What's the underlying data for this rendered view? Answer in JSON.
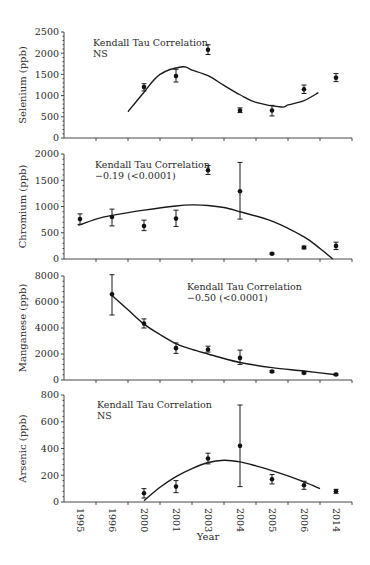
{
  "chart_data": {
    "type": "scatter",
    "x_title": "Year",
    "categories": [
      "1995",
      "1996",
      "2000",
      "2001",
      "2003",
      "2004",
      "2005",
      "2006",
      "2014"
    ],
    "panels": [
      {
        "name": "selenium",
        "ylabel": "Selenium (ppb)",
        "ylim": [
          0,
          2500
        ],
        "yticks": [
          0,
          500,
          1000,
          1500,
          2000,
          2500
        ],
        "annotation": [
          "Kendall Tau Correlation",
          "NS"
        ],
        "points": [
          {
            "x": "2000",
            "y": 1200,
            "err": [
              1110,
              1280
            ]
          },
          {
            "x": "2001",
            "y": 1460,
            "err": [
              1320,
              1620
            ]
          },
          {
            "x": "2003",
            "y": 2080,
            "err": [
              1970,
              2200
            ]
          },
          {
            "x": "2004",
            "y": 650,
            "err": [
              600,
              710
            ]
          },
          {
            "x": "2005",
            "y": 650,
            "err": [
              520,
              770
            ]
          },
          {
            "x": "2006",
            "y": 1150,
            "err": [
              1050,
              1250
            ]
          },
          {
            "x": "2014",
            "y": 1420,
            "err": [
              1330,
              1520
            ]
          }
        ],
        "fit_curve": [
          [
            "2000",
            -0.5,
            620
          ],
          [
            "2000",
            0,
            1080
          ],
          [
            "2001",
            -0.5,
            1500
          ],
          [
            "2001",
            0.2,
            1680
          ],
          [
            "2003",
            -0.5,
            1600
          ],
          [
            "2003",
            0,
            1470
          ],
          [
            "2004",
            -0.5,
            1240
          ],
          [
            "2004",
            0,
            1020
          ],
          [
            "2005",
            -0.5,
            840
          ],
          [
            "2005",
            0.3,
            730
          ],
          [
            "2006",
            -0.5,
            780
          ],
          [
            "2006",
            0,
            880
          ],
          [
            "2006",
            0.45,
            1070
          ]
        ]
      },
      {
        "name": "chromium",
        "ylabel": "Chromium (ppb)",
        "ylim": [
          0,
          2000
        ],
        "yticks": [
          0,
          500,
          1000,
          1500,
          2000
        ],
        "annotation": [
          "Kendall Tau Correlation",
          "−0.19 (<0.0001)"
        ],
        "points": [
          {
            "x": "1995",
            "y": 760,
            "err": [
              660,
              860
            ]
          },
          {
            "x": "1996",
            "y": 800,
            "err": [
              630,
              950
            ]
          },
          {
            "x": "2000",
            "y": 630,
            "err": [
              540,
              740
            ]
          },
          {
            "x": "2001",
            "y": 770,
            "err": [
              620,
              930
            ]
          },
          {
            "x": "2003",
            "y": 1690,
            "err": [
              1610,
              1780
            ]
          },
          {
            "x": "2004",
            "y": 1290,
            "err": [
              760,
              1840
            ]
          },
          {
            "x": "2005",
            "y": 100,
            "err": [
              85,
              115
            ]
          },
          {
            "x": "2006",
            "y": 220,
            "err": [
              195,
              245
            ]
          },
          {
            "x": "2014",
            "y": 250,
            "err": [
              180,
              320
            ]
          }
        ],
        "fit_curve": [
          [
            "1995",
            -0.05,
            640
          ],
          [
            "1996",
            -0.5,
            760
          ],
          [
            "1996",
            0,
            830
          ],
          [
            "2000",
            0,
            930
          ],
          [
            "2001",
            0,
            1010
          ],
          [
            "2003",
            -0.5,
            1030
          ],
          [
            "2003",
            0,
            1020
          ],
          [
            "2004",
            -0.5,
            980
          ],
          [
            "2004",
            0,
            900
          ],
          [
            "2005",
            0,
            720
          ],
          [
            "2006",
            0,
            420
          ],
          [
            "2014",
            -0.5,
            200
          ],
          [
            "2014",
            -0.1,
            0
          ]
        ]
      },
      {
        "name": "manganese",
        "ylabel": "Manganese (ppb)",
        "ylim": [
          0,
          8000
        ],
        "yticks": [
          0,
          2000,
          4000,
          6000,
          8000
        ],
        "annotation": [
          "Kendall Tau Correlation",
          "−0.50 (<0.0001)"
        ],
        "points": [
          {
            "x": "1996",
            "y": 6600,
            "err": [
              5000,
              8100
            ]
          },
          {
            "x": "2000",
            "y": 4350,
            "err": [
              4000,
              4700
            ]
          },
          {
            "x": "2001",
            "y": 2450,
            "err": [
              2050,
              2850
            ]
          },
          {
            "x": "2003",
            "y": 2350,
            "err": [
              2150,
              2600
            ]
          },
          {
            "x": "2004",
            "y": 1700,
            "err": [
              1200,
              2300
            ]
          },
          {
            "x": "2005",
            "y": 650,
            "err": [
              580,
              720
            ]
          },
          {
            "x": "2006",
            "y": 550,
            "err": [
              480,
              620
            ]
          },
          {
            "x": "2014",
            "y": 420,
            "err": [
              360,
              480
            ]
          }
        ],
        "fit_curve": [
          [
            "1996",
            0,
            6500
          ],
          [
            "1996",
            0.5,
            5400
          ],
          [
            "2000",
            0,
            4300
          ],
          [
            "2000",
            0.5,
            3500
          ],
          [
            "2001",
            0,
            2800
          ],
          [
            "2001",
            0.5,
            2350
          ],
          [
            "2003",
            0,
            2000
          ],
          [
            "2003",
            0.5,
            1650
          ],
          [
            "2004",
            0,
            1350
          ],
          [
            "2005",
            0,
            950
          ],
          [
            "2006",
            0,
            690
          ],
          [
            "2014",
            0,
            400
          ]
        ]
      },
      {
        "name": "arsenic",
        "ylabel": "Arsenic (ppb)",
        "ylim": [
          0,
          800
        ],
        "yticks": [
          0,
          200,
          400,
          600,
          800
        ],
        "annotation": [
          "Kendall Tau Correlation",
          "NS"
        ],
        "points": [
          {
            "x": "2000",
            "y": 65,
            "err": [
              30,
              100
            ]
          },
          {
            "x": "2001",
            "y": 115,
            "err": [
              70,
              160
            ]
          },
          {
            "x": "2003",
            "y": 325,
            "err": [
              285,
              365
            ]
          },
          {
            "x": "2004",
            "y": 420,
            "err": [
              115,
              725
            ]
          },
          {
            "x": "2005",
            "y": 170,
            "err": [
              135,
              205
            ]
          },
          {
            "x": "2006",
            "y": 125,
            "err": [
              95,
              155
            ]
          },
          {
            "x": "2014",
            "y": 80,
            "err": [
              65,
              95
            ]
          }
        ],
        "fit_curve": [
          [
            "2000",
            0,
            10
          ],
          [
            "2000",
            0.5,
            110
          ],
          [
            "2001",
            0,
            190
          ],
          [
            "2001",
            0.5,
            250
          ],
          [
            "2003",
            0,
            295
          ],
          [
            "2003",
            0.5,
            312
          ],
          [
            "2004",
            0,
            300
          ],
          [
            "2004",
            0.5,
            270
          ],
          [
            "2005",
            0,
            235
          ],
          [
            "2005",
            0.5,
            195
          ],
          [
            "2006",
            0,
            150
          ],
          [
            "2006",
            0.5,
            100
          ]
        ]
      }
    ]
  },
  "labels": {
    "x_title": "Year",
    "selenium_ylabel": "Selenium (ppb)",
    "chromium_ylabel": "Chromium (ppb)",
    "manganese_ylabel": "Manganese (ppb)",
    "arsenic_ylabel": "Arsenic (ppb)"
  }
}
